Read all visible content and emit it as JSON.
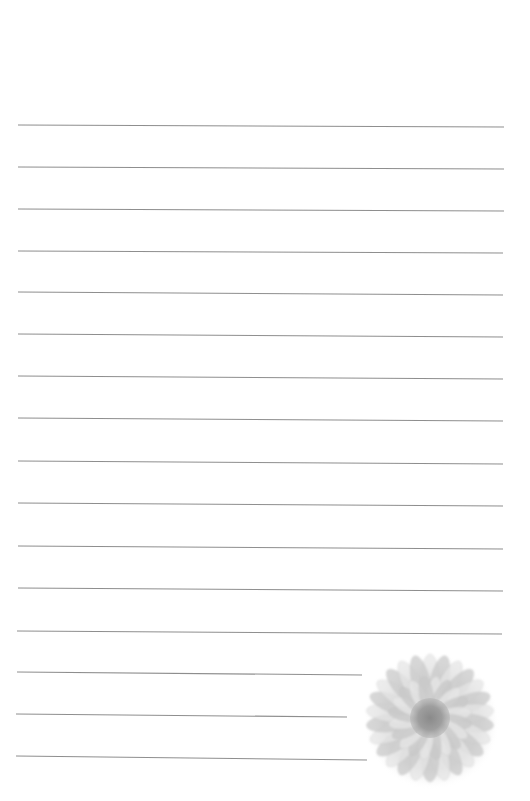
{
  "page": {
    "type": "lined-stationery",
    "background": "#ffffff",
    "line_color": "#7a7a7a",
    "line_width": 1.1
  },
  "lines": [
    {
      "x1": 18,
      "y1": 125,
      "x2": 504,
      "y2": 127
    },
    {
      "x1": 18,
      "y1": 167,
      "x2": 504,
      "y2": 169
    },
    {
      "x1": 18,
      "y1": 209,
      "x2": 504,
      "y2": 211
    },
    {
      "x1": 18,
      "y1": 251,
      "x2": 503,
      "y2": 253
    },
    {
      "x1": 18,
      "y1": 292,
      "x2": 503,
      "y2": 295
    },
    {
      "x1": 18,
      "y1": 334,
      "x2": 503,
      "y2": 337
    },
    {
      "x1": 18,
      "y1": 376,
      "x2": 503,
      "y2": 379
    },
    {
      "x1": 18,
      "y1": 418,
      "x2": 503,
      "y2": 421
    },
    {
      "x1": 18,
      "y1": 461,
      "x2": 503,
      "y2": 464
    },
    {
      "x1": 18,
      "y1": 503,
      "x2": 503,
      "y2": 506
    },
    {
      "x1": 18,
      "y1": 546,
      "x2": 503,
      "y2": 549
    },
    {
      "x1": 18,
      "y1": 588,
      "x2": 503,
      "y2": 591
    },
    {
      "x1": 17,
      "y1": 631,
      "x2": 502,
      "y2": 634
    },
    {
      "x1": 17,
      "y1": 672,
      "x2": 362,
      "y2": 675
    },
    {
      "x1": 16,
      "y1": 714,
      "x2": 347,
      "y2": 717
    },
    {
      "x1": 16,
      "y1": 756,
      "x2": 367,
      "y2": 760
    }
  ],
  "flower": {
    "icon": "gerbera-flower-icon",
    "petal_color": "#c9c9c9",
    "petal_highlight": "#e6e6e6",
    "center_color": "#8f8f8f"
  }
}
